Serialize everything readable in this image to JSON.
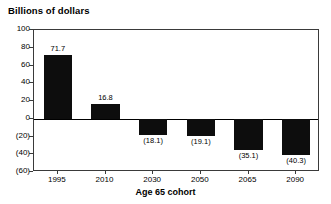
{
  "chart_data": {
    "type": "bar",
    "title": "Billions of dollars",
    "xlabel": "Age 65 cohort",
    "ylabel": "",
    "categories": [
      "1995",
      "2010",
      "2030",
      "2050",
      "2065",
      "2090"
    ],
    "values": [
      71.7,
      16.8,
      -18.1,
      -19.1,
      -35.1,
      -40.3
    ],
    "data_labels": [
      "71.7",
      "16.8",
      "(18.1)",
      "(19.1)",
      "(35.1)",
      "(40.3)"
    ],
    "ylim": [
      -60,
      100
    ],
    "ytick_values": [
      100,
      80,
      60,
      40,
      20,
      0,
      -20,
      -40,
      -60
    ],
    "ytick_labels": [
      "100",
      "80",
      "60",
      "40",
      "20",
      "0",
      "(20)",
      "(40)",
      "(60)"
    ],
    "grid": false,
    "legend": null,
    "bar_color": "#0d0d0d",
    "axis_color": "#3a3a3a"
  }
}
